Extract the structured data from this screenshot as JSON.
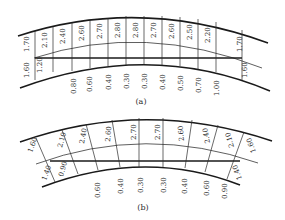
{
  "diagrams": [
    {
      "caption": "(a)",
      "top_labels": [
        "1.70",
        "2.10",
        "2.40",
        "2.60",
        "2.70",
        "2.80",
        "2.80",
        "2.70",
        "2.60",
        "2.50",
        "2.20",
        "1.70"
      ],
      "inner_left_labels": [
        "1.60",
        "1.20"
      ],
      "inner_right_label": "1.60",
      "bottom_labels": [
        "0.80",
        "0.60",
        "0.40",
        "0.30",
        "0.30",
        "0.40",
        "0.50",
        "0.70",
        "1.00"
      ]
    },
    {
      "caption": "(b)",
      "top_labels": [
        "1.60",
        "2.10",
        "2.40",
        "2.60",
        "2.70",
        "2.70",
        "2.60",
        "2.40",
        "2.10",
        "1.60"
      ],
      "inner_left_labels": [
        "1.40",
        "0.90"
      ],
      "inner_right_label": "1.40",
      "bottom_labels": [
        "0.60",
        "0.40",
        "0.30",
        "0.30",
        "0.40",
        "0.60",
        "0.90"
      ]
    }
  ]
}
